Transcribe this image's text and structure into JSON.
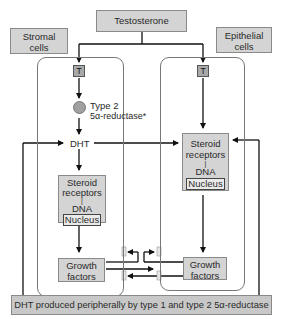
{
  "diagram": {
    "source": "Testosterone",
    "labels": {
      "stromal": [
        "Stromal",
        "cells"
      ],
      "epithelial": [
        "Epithelial",
        "cells"
      ]
    },
    "stromal_cell": {
      "testosterone_abbrev": "T",
      "enzyme": [
        "Type 2",
        "5α-reductase*"
      ],
      "product": "DHT",
      "receptor_box": [
        "Steroid",
        "receptors",
        "|",
        "DNA"
      ],
      "nucleus": "Nucleus",
      "growth_factors": [
        "Growth",
        "factors"
      ]
    },
    "epithelial_cell": {
      "testosterone_abbrev": "T",
      "receptor_box": [
        "Steroid",
        "receptors",
        "|",
        "DNA"
      ],
      "nucleus": "Nucleus",
      "growth_factors": [
        "Growth",
        "factors"
      ]
    },
    "footer": "DHT produced peripherally by type 1 and type 2 5α-reductase",
    "colors": {
      "box_fill": "#d4d4d4",
      "t_fill": "#a9a9a9",
      "enzyme_circle": "#a0a0a0",
      "footer_fill": "#c8c8c8",
      "line": "#111111"
    }
  }
}
